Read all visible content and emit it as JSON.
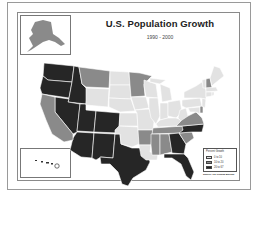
{
  "title": "U.S. Population Growth",
  "subtitle": "1990 - 2000",
  "colors": {
    "low": "#e2e2e2",
    "medium": "#8a8a8a",
    "high": "#262626",
    "border": "#ffffff",
    "frame": "#8a8a8a"
  },
  "legend": {
    "title": "Percent Growth",
    "items": [
      {
        "label": "0 to 10",
        "color": "#e2e2e2"
      },
      {
        "label": "10 to 20",
        "color": "#8a8a8a"
      },
      {
        "label": "20 to 67",
        "color": "#262626"
      }
    ]
  },
  "source": "Source: US Census Bureau",
  "insets": {
    "alaska": {
      "label": "Alaska",
      "class": "medium"
    },
    "hawaii": {
      "label": "Hawaii",
      "class": "high"
    }
  },
  "states": {
    "high": [
      "WA",
      "OR",
      "ID",
      "NV",
      "UT",
      "AZ",
      "CO",
      "NM",
      "TX",
      "GA",
      "NC",
      "FL",
      "HI"
    ],
    "medium": [
      "MT",
      "CA",
      "MN",
      "AR",
      "TN",
      "MS",
      "AL",
      "SC",
      "VA",
      "NH",
      "DE",
      "WY-border",
      "AK"
    ],
    "low": [
      "ND",
      "SD",
      "NE",
      "KS",
      "OK",
      "WY",
      "IA",
      "MO",
      "WI",
      "IL",
      "MI",
      "IN",
      "OH",
      "KY",
      "WV",
      "PA",
      "NY",
      "VT",
      "ME",
      "MA",
      "CT",
      "RI",
      "NJ",
      "MD",
      "LA"
    ]
  }
}
